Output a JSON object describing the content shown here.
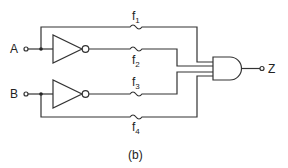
{
  "diagram": {
    "caption": "(b)",
    "inputs": [
      {
        "id": "A",
        "label": "A"
      },
      {
        "id": "B",
        "label": "B"
      }
    ],
    "output": {
      "id": "Z",
      "label": "Z"
    },
    "gates": [
      {
        "id": "not-a",
        "type": "NOT",
        "input": "A"
      },
      {
        "id": "not-b",
        "type": "NOT",
        "input": "B"
      },
      {
        "id": "and-1",
        "type": "AND",
        "inputs": [
          "f1",
          "f2",
          "f3",
          "f4"
        ],
        "output": "Z"
      }
    ],
    "signals": [
      {
        "id": "f1",
        "base": "f",
        "sub": "1",
        "source": "A"
      },
      {
        "id": "f2",
        "base": "f",
        "sub": "2",
        "source": "NOT A"
      },
      {
        "id": "f3",
        "base": "f",
        "sub": "3",
        "source": "NOT B"
      },
      {
        "id": "f4",
        "base": "f",
        "sub": "4",
        "source": "B"
      }
    ]
  }
}
